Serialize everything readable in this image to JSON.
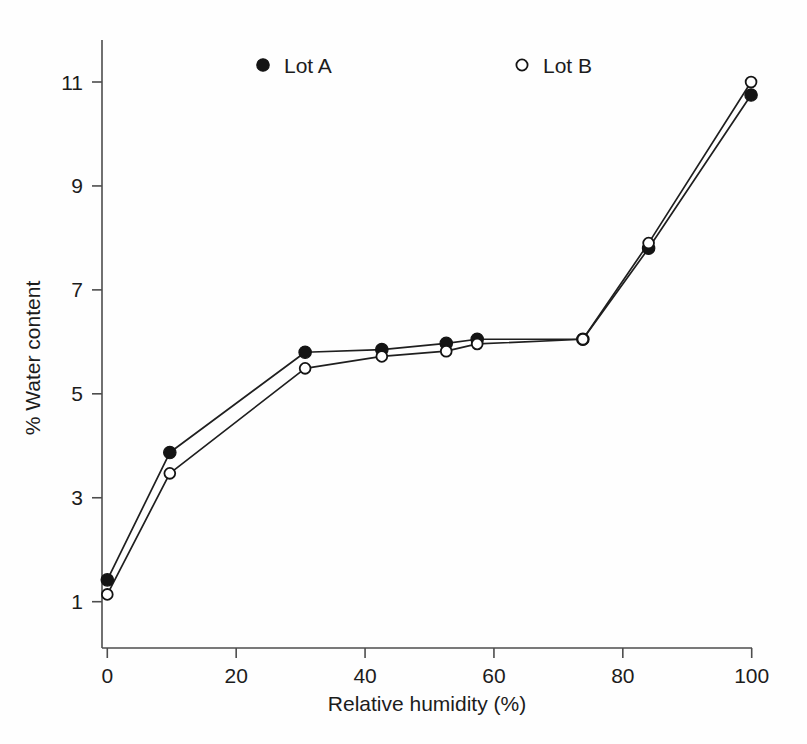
{
  "chart_data": {
    "type": "line",
    "title": "",
    "xlabel": "Relative humidity (%)",
    "ylabel": "% Water content",
    "xlim": [
      0,
      100
    ],
    "ylim": [
      0,
      11.8
    ],
    "xticks": [
      0,
      20,
      40,
      60,
      80,
      100
    ],
    "xtick_labels": [
      "0",
      "20",
      "40",
      "60",
      "80",
      "100"
    ],
    "yticks": [
      1,
      3,
      5,
      7,
      9,
      11
    ],
    "ytick_labels": [
      "1",
      "3",
      "5",
      "7",
      "9",
      "11"
    ],
    "grid": false,
    "legend_position": "top-inside",
    "series": [
      {
        "name": "Lot A",
        "marker": "filled-circle",
        "x": [
          0,
          9.7,
          30.7,
          42.6,
          52.6,
          57.4,
          73.8,
          84.0,
          99.9
        ],
        "y": [
          1.42,
          3.87,
          5.8,
          5.85,
          5.97,
          6.05,
          6.05,
          7.8,
          10.75
        ]
      },
      {
        "name": "Lot B",
        "marker": "open-circle",
        "x": [
          0,
          9.7,
          30.7,
          42.6,
          52.6,
          57.4,
          73.8,
          84.0,
          99.9
        ],
        "y": [
          1.14,
          3.47,
          5.49,
          5.72,
          5.82,
          5.96,
          6.05,
          7.9,
          11.0
        ]
      }
    ]
  },
  "legend": {
    "entries": [
      {
        "label": "Lot A",
        "marker": "filled-circle"
      },
      {
        "label": "Lot B",
        "marker": "open-circle"
      }
    ]
  },
  "colors": {
    "ink": "#141414",
    "axis": "#4d4d4d",
    "background": "#ffffff"
  }
}
